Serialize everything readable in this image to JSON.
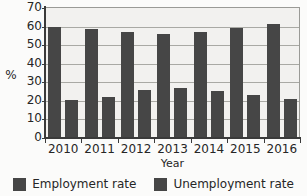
{
  "chart_data": {
    "type": "bar",
    "title": "",
    "xlabel": "Year",
    "ylabel": "%",
    "categories": [
      "2010",
      "2011",
      "2012",
      "2013",
      "2014",
      "2015",
      "2016"
    ],
    "series": [
      {
        "name": "Employment rate",
        "color": "#464646",
        "values": [
          59,
          58,
          56.5,
          55.5,
          56.5,
          58.5,
          61
        ]
      },
      {
        "name": "Unemployment rate",
        "color": "#464646",
        "values": [
          20,
          21.5,
          25.5,
          26.5,
          25,
          22.5,
          20.5
        ]
      }
    ],
    "ylim": [
      0,
      70
    ],
    "ytick_step": 10,
    "yticks": [
      "0",
      "10",
      "20",
      "30",
      "40",
      "50",
      "60",
      "70"
    ],
    "grid": true,
    "legend_position": "bottom",
    "plot_background": "#f2f1ef",
    "axis_color": "#3a3a3a",
    "gridline_color": "#a9a9a4"
  },
  "legend": {
    "items": [
      {
        "label": "Employment rate"
      },
      {
        "label": "Unemployment rate"
      }
    ]
  }
}
